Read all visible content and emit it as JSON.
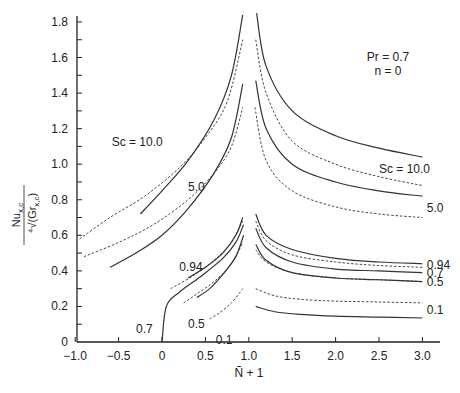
{
  "chart_data": {
    "type": "line",
    "title": "",
    "xlabel": "Ñ + 1",
    "ylabel": "Nu_x,c / ⁴√(Gr_x,c)",
    "xlim": [
      -1.0,
      3.2
    ],
    "ylim": [
      0,
      1.85
    ],
    "xticks": [
      -1.0,
      -0.5,
      0,
      0.5,
      1.0,
      1.5,
      2.0,
      2.5,
      3.0
    ],
    "xtick_labels": [
      "−1.0",
      "−0.5",
      "0",
      "0.5",
      "1.0",
      "1.5",
      "2.0",
      "2.5",
      "3.0"
    ],
    "yticks": [
      0,
      0.2,
      0.4,
      0.6,
      0.8,
      1.0,
      1.2,
      1.4,
      1.6,
      1.8
    ],
    "ytick_labels": [
      "0",
      "0.2",
      "0.4",
      "0.6",
      "0.8",
      "1.0",
      "1.2",
      "1.4",
      "1.6",
      "1.8"
    ],
    "grid": false,
    "annotation": {
      "line1": "Pr = 0.7",
      "line2": "n = 0"
    },
    "series": [
      {
        "name": "Sc=10.0 solid left",
        "style": "solid",
        "x": [
          -0.25,
          0.0,
          0.3,
          0.6,
          0.8,
          0.93
        ],
        "y": [
          0.72,
          0.85,
          1.02,
          1.25,
          1.5,
          1.84
        ]
      },
      {
        "name": "Sc=10.0 dashed left",
        "style": "dashed",
        "x": [
          -0.95,
          -0.6,
          -0.2,
          0.2,
          0.5,
          0.75,
          0.93
        ],
        "y": [
          0.58,
          0.7,
          0.82,
          0.98,
          1.15,
          1.35,
          1.7
        ]
      },
      {
        "name": "Sc=10.0 solid right",
        "style": "solid",
        "x": [
          1.09,
          1.2,
          1.5,
          2.0,
          2.5,
          3.0
        ],
        "y": [
          1.85,
          1.55,
          1.3,
          1.16,
          1.09,
          1.04
        ]
      },
      {
        "name": "Sc=10.0 dashed right",
        "style": "dashed",
        "x": [
          1.08,
          1.2,
          1.5,
          2.0,
          2.5,
          3.0
        ],
        "y": [
          1.7,
          1.4,
          1.13,
          1.0,
          0.93,
          0.88
        ]
      },
      {
        "name": "Sc=5.0 solid left",
        "style": "solid",
        "x": [
          -0.6,
          -0.3,
          0.0,
          0.3,
          0.6,
          0.8,
          0.93
        ],
        "y": [
          0.42,
          0.5,
          0.6,
          0.75,
          0.95,
          1.15,
          1.45
        ]
      },
      {
        "name": "Sc=5.0 dashed left",
        "style": "dashed",
        "x": [
          -0.9,
          -0.5,
          -0.1,
          0.3,
          0.6,
          0.8,
          0.93
        ],
        "y": [
          0.48,
          0.56,
          0.66,
          0.8,
          0.95,
          1.1,
          1.32
        ]
      },
      {
        "name": "Sc=5.0 solid right",
        "style": "solid",
        "x": [
          1.08,
          1.2,
          1.5,
          2.0,
          2.5,
          3.0
        ],
        "y": [
          1.47,
          1.2,
          1.0,
          0.9,
          0.85,
          0.82
        ]
      },
      {
        "name": "Sc=5.0 dashed right",
        "style": "dashed",
        "x": [
          1.07,
          1.2,
          1.5,
          2.0,
          2.5,
          3.0
        ],
        "y": [
          1.32,
          1.02,
          0.85,
          0.76,
          0.72,
          0.7
        ]
      },
      {
        "name": "Sc=0.94 solid left",
        "style": "solid",
        "x": [
          0.3,
          0.5,
          0.7,
          0.85,
          0.93
        ],
        "y": [
          0.36,
          0.42,
          0.5,
          0.6,
          0.7
        ]
      },
      {
        "name": "Sc=0.94 dashed left",
        "style": "dashed",
        "x": [
          0.1,
          0.35,
          0.6,
          0.8,
          0.93
        ],
        "y": [
          0.3,
          0.37,
          0.46,
          0.56,
          0.68
        ]
      },
      {
        "name": "Sc=0.7 solid left",
        "style": "solid",
        "x": [
          0.0,
          0.05,
          0.2,
          0.45,
          0.7,
          0.85,
          0.94
        ],
        "y": [
          0.0,
          0.2,
          0.28,
          0.37,
          0.47,
          0.56,
          0.66
        ]
      },
      {
        "name": "Sc=0.5 solid left",
        "style": "solid",
        "x": [
          0.4,
          0.55,
          0.7,
          0.85,
          0.94
        ],
        "y": [
          0.25,
          0.3,
          0.38,
          0.48,
          0.6
        ]
      },
      {
        "name": "Sc=0.5 dashed left",
        "style": "dashed",
        "x": [
          0.25,
          0.4,
          0.6,
          0.8,
          0.93
        ],
        "y": [
          0.22,
          0.27,
          0.34,
          0.44,
          0.56
        ]
      },
      {
        "name": "Sc=0.1 dashed left",
        "style": "dashed",
        "x": [
          0.55,
          0.65,
          0.8,
          0.93
        ],
        "y": [
          0.13,
          0.16,
          0.22,
          0.3
        ]
      },
      {
        "name": "Sc=0.94 solid right",
        "style": "solid",
        "x": [
          1.08,
          1.2,
          1.5,
          2.0,
          2.5,
          3.0
        ],
        "y": [
          0.72,
          0.6,
          0.52,
          0.47,
          0.45,
          0.44
        ]
      },
      {
        "name": "Sc=0.94 dashed right",
        "style": "dashed",
        "x": [
          1.08,
          1.2,
          1.5,
          2.0,
          2.5,
          3.0
        ],
        "y": [
          0.68,
          0.57,
          0.49,
          0.45,
          0.43,
          0.42
        ]
      },
      {
        "name": "Sc=0.7 solid right",
        "style": "solid",
        "x": [
          1.08,
          1.2,
          1.5,
          2.0,
          2.5,
          3.0
        ],
        "y": [
          0.64,
          0.53,
          0.45,
          0.41,
          0.4,
          0.39
        ]
      },
      {
        "name": "Sc=0.5 solid right",
        "style": "solid",
        "x": [
          1.08,
          1.2,
          1.5,
          2.0,
          2.5,
          3.0
        ],
        "y": [
          0.55,
          0.46,
          0.39,
          0.36,
          0.35,
          0.34
        ]
      },
      {
        "name": "Sc=0.5 dashed right",
        "style": "dashed",
        "x": [
          1.08,
          1.2,
          1.5,
          2.0,
          2.5,
          3.0
        ],
        "y": [
          0.52,
          0.45,
          0.39,
          0.36,
          0.35,
          0.34
        ]
      },
      {
        "name": "Sc=0.1 dashed right",
        "style": "dashed",
        "x": [
          1.08,
          1.3,
          1.6,
          2.0,
          2.5,
          3.0
        ],
        "y": [
          0.3,
          0.26,
          0.24,
          0.23,
          0.225,
          0.22
        ]
      },
      {
        "name": "Sc=0.1 solid right",
        "style": "solid",
        "x": [
          1.08,
          1.3,
          1.6,
          2.0,
          2.5,
          3.0
        ],
        "y": [
          0.2,
          0.17,
          0.155,
          0.145,
          0.14,
          0.135
        ]
      }
    ],
    "labels": [
      {
        "text": "Sc = 10.0",
        "x": -0.58,
        "y": 1.1
      },
      {
        "text": "5.0",
        "x": 0.3,
        "y": 0.85
      },
      {
        "text": "0.94",
        "x": 0.2,
        "y": 0.4
      },
      {
        "text": "0.7",
        "x": -0.3,
        "y": 0.05
      },
      {
        "text": "0.5",
        "x": 0.3,
        "y": 0.08
      },
      {
        "text": "0.1",
        "x": 0.62,
        "y": -0.01
      },
      {
        "text": "Sc = 10.0",
        "x": 2.5,
        "y": 0.95
      },
      {
        "text": "5.0",
        "x": 3.05,
        "y": 0.73
      },
      {
        "text": "0.94",
        "x": 3.05,
        "y": 0.41
      },
      {
        "text": "0.7",
        "x": 3.05,
        "y": 0.365
      },
      {
        "text": "0.5",
        "x": 3.05,
        "y": 0.315
      },
      {
        "text": "0.1",
        "x": 3.05,
        "y": 0.16
      }
    ]
  }
}
